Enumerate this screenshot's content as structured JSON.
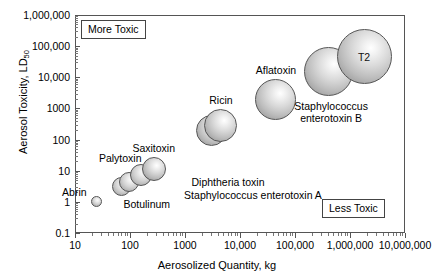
{
  "chart_data": {
    "type": "scatter",
    "title": "",
    "xlabel": "Aerosolized Quantity, kg",
    "ylabel": "Aerosol Toxicity, LD50",
    "ylabel_main": "Aerosol Toxicity, LD",
    "ylabel_sub": "50",
    "xscale": "log",
    "yscale": "log",
    "xlim": [
      10,
      10000000
    ],
    "ylim": [
      0.1,
      1000000
    ],
    "grid": false,
    "legend": "none",
    "xticks": [
      "10",
      "100",
      "1000",
      "10,000",
      "100,000",
      "1,000,000",
      "10,000,000"
    ],
    "xtick_values": [
      10,
      100,
      1000,
      10000,
      100000,
      1000000,
      10000000
    ],
    "yticks": [
      "1,000,000",
      "100,000",
      "10,000",
      "1000",
      "100",
      "10",
      "1",
      "0.1"
    ],
    "ytick_values": [
      1000000,
      100000,
      10000,
      1000,
      100,
      10,
      1,
      0.1
    ],
    "annotations": [
      {
        "text": "More Toxic",
        "position": "top-left"
      },
      {
        "text": "Less Toxic",
        "position": "bottom-right"
      }
    ],
    "points": [
      {
        "name": "Abrin",
        "x": 25,
        "y": 1,
        "size_px": 11,
        "label": "Abrin",
        "label_pos": "left"
      },
      {
        "name": "Botulinum-a",
        "x": 70,
        "y": 3,
        "size_px": 19,
        "label": "",
        "label_pos": "below"
      },
      {
        "name": "Botulinum-b",
        "x": 95,
        "y": 4.5,
        "size_px": 20,
        "label": "Botulinum",
        "label_pos": "below"
      },
      {
        "name": "Palytoxin",
        "x": 160,
        "y": 7.5,
        "size_px": 22,
        "label": "Palytoxin",
        "label_pos": "above-left"
      },
      {
        "name": "Saxitoxin",
        "x": 270,
        "y": 11,
        "size_px": 24,
        "label": "Saxitoxin",
        "label_pos": "above"
      },
      {
        "name": "Ricin-a",
        "x": 3000,
        "y": 200,
        "size_px": 31,
        "label": "",
        "label_pos": "above"
      },
      {
        "name": "Ricin-b",
        "x": 4500,
        "y": 280,
        "size_px": 33,
        "label": "Ricin",
        "label_pos": "above"
      },
      {
        "name": "Aflatoxin",
        "x": 45000,
        "y": 2000,
        "size_px": 41,
        "label": "Aflatoxin",
        "label_pos": "above"
      },
      {
        "name": "Staphylococcus enterotoxin B",
        "x": 400000,
        "y": 15000,
        "size_px": 49,
        "label": "Staphylococcus\nenterotoxin B",
        "label_pos": "below-right"
      },
      {
        "name": "T2",
        "x": 1800000,
        "y": 45000,
        "size_px": 55,
        "label": "T2",
        "label_pos": "inside"
      }
    ],
    "text_annotations": [
      {
        "text": "Diphtheria toxin",
        "x_px": 228,
        "y_px": 176
      },
      {
        "text": "Staphylococcus enterotoxin A",
        "x_px": 253,
        "y_px": 189
      }
    ]
  },
  "axes": {
    "y_title_main": "Aerosol Toxicity, LD",
    "y_title_sub": "50",
    "x_title": "Aerosolized Quantity, kg"
  },
  "tags": {
    "more_toxic": "More Toxic",
    "less_toxic": "Less Toxic"
  },
  "labels": {
    "abrin": "Abrin",
    "botulinum": "Botulinum",
    "palytoxin": "Palytoxin",
    "saxitoxin": "Saxitoxin",
    "ricin": "Ricin",
    "aflatoxin": "Aflatoxin",
    "seb_line1": "Staphylococcus",
    "seb_line2": "enterotoxin B",
    "t2": "T2",
    "diphtheria": "Diphtheria toxin",
    "sea": "Staphylococcus enterotoxin A"
  },
  "colors": {
    "frame": "#555555",
    "bubble_edge": "#555555",
    "bubble_fill_light": "#ffffff",
    "bubble_fill_dark": "#8a8a8a",
    "background": "#ffffff",
    "text": "#000000"
  }
}
